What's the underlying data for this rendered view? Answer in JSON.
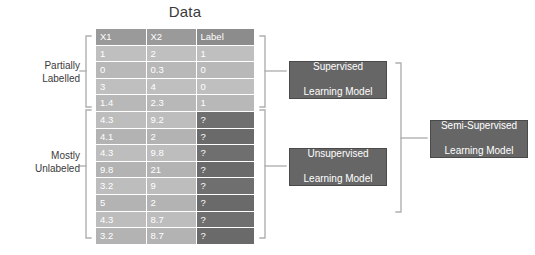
{
  "title": "Data",
  "colors": {
    "bracket": "#b0b0b0",
    "box_fill": "#666666",
    "box_border": "#4a4a4a",
    "header_fill": "#9a9a9a",
    "labelled_cell": "#bdbdbd",
    "unlabelled_cell": "#6f6f6f",
    "text": "#3a3a3a"
  },
  "table": {
    "name": "Data",
    "columns": [
      "X1",
      "X2",
      "Label"
    ],
    "rows": [
      {
        "x1": "1",
        "x2": "2",
        "label": "1",
        "labelled": true
      },
      {
        "x1": "0",
        "x2": "0.3",
        "label": "0",
        "labelled": true
      },
      {
        "x1": "3",
        "x2": "4",
        "label": "0",
        "labelled": true
      },
      {
        "x1": "1.4",
        "x2": "2.3",
        "label": "1",
        "labelled": true
      },
      {
        "x1": "4.3",
        "x2": "9.2",
        "label": "?",
        "labelled": false
      },
      {
        "x1": "4.1",
        "x2": "2",
        "label": "?",
        "labelled": false
      },
      {
        "x1": "4.3",
        "x2": "9.8",
        "label": "?",
        "labelled": false
      },
      {
        "x1": "9.8",
        "x2": "21",
        "label": "?",
        "labelled": false
      },
      {
        "x1": "3.2",
        "x2": "9",
        "label": "?",
        "labelled": false
      },
      {
        "x1": "5",
        "x2": "2",
        "label": "?",
        "labelled": false
      },
      {
        "x1": "4.3",
        "x2": "8.7",
        "label": "?",
        "labelled": false
      },
      {
        "x1": "3.2",
        "x2": "8.7",
        "label": "?",
        "labelled": false
      }
    ]
  },
  "side_labels": {
    "partially_line1": "Partially",
    "partially_line2": "Labelled",
    "mostly_line1": "Mostly",
    "mostly_line2": "Unlabeled"
  },
  "models": {
    "supervised_line1": "Supervised",
    "supervised_line2": "Learning Model",
    "unsupervised_line1": "Unsupervised",
    "unsupervised_line2": "Learning Model",
    "semi_line1": "Semi-Supervised",
    "semi_line2": "Learning Model"
  }
}
